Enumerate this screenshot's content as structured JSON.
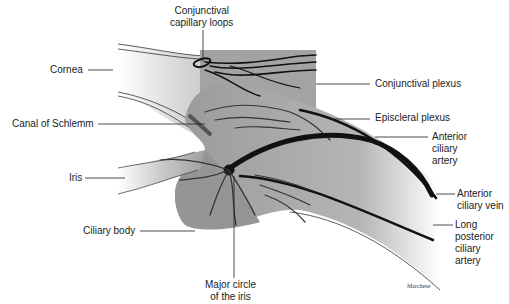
{
  "figure": {
    "type": "anatomical-illustration"
  },
  "labels": {
    "conjunctival_capillary_loops": "Conjunctival\ncapillary loops",
    "cornea": "Cornea",
    "conjunctival_plexus": "Conjunctival plexus",
    "canal_of_schlemm": "Canal of Schlemm",
    "episcleral_plexus": "Episcleral plexus",
    "anterior_ciliary_artery": "Anterior\nciliary\nartery",
    "iris": "Iris",
    "anterior_ciliary_vein": "Anterior\nciliary vein",
    "ciliary_body": "Ciliary body",
    "long_posterior_ciliary_artery": "Long\nposterior\nciliary\nartery",
    "major_circle_of_iris": "Major circle\nof the iris"
  },
  "signature": "Marchese",
  "colors": {
    "tissue": "#9a9a9a",
    "tissue_light": "#c8c8c8",
    "vessel": "#111111",
    "leader_line": "#222222",
    "background": "#ffffff"
  }
}
